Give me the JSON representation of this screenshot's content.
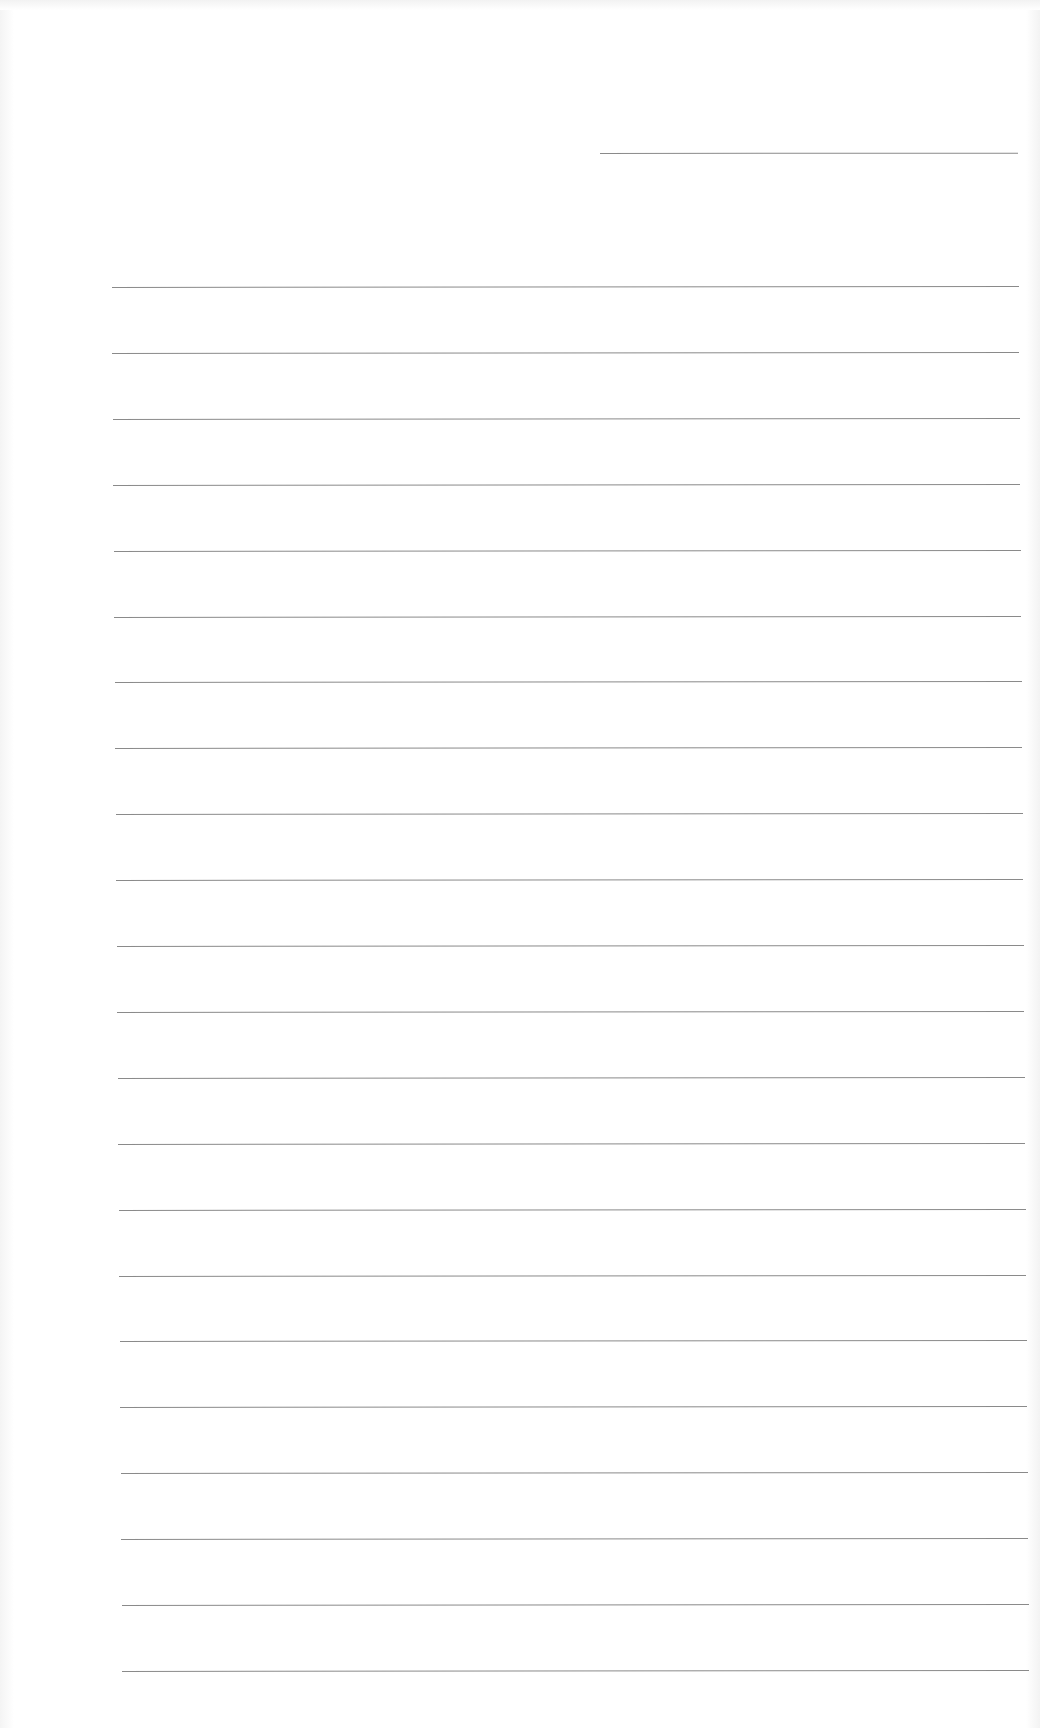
{
  "document": {
    "type": "lined-paper",
    "content_text": "",
    "header_line": {
      "x1": 600,
      "x2": 1018,
      "y": 153
    },
    "rules": {
      "count": 24,
      "first_y": 287,
      "spacing": 65.9,
      "x_start_top": 112,
      "x_start_bottom": 123,
      "x_end_top": 1019,
      "x_end_bottom": 1030
    },
    "colors": {
      "paper": "#ffffff",
      "line": "#8a8a8a"
    }
  }
}
